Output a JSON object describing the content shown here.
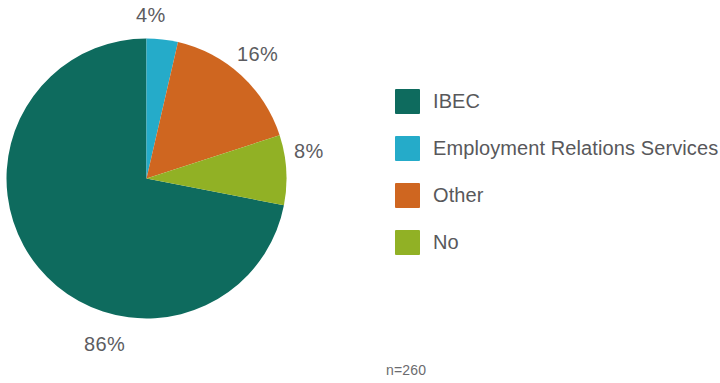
{
  "chart_data": {
    "type": "pie",
    "title": "",
    "subtitle": "",
    "xlabel": "",
    "ylabel": "",
    "grid": false,
    "legend_position": "right",
    "sample_note": "n=260",
    "categories": [
      "IBEC",
      "Employment Relations Services",
      "Other",
      "No"
    ],
    "values": [
      86,
      4,
      16,
      8
    ],
    "value_labels": [
      "86%",
      "4%",
      "16%",
      "8%"
    ],
    "colors": [
      "#0e6b5e",
      "#25abc9",
      "#cf6620",
      "#91b125"
    ],
    "slices": [
      {
        "label": "IBEC",
        "value": 86,
        "value_label": "86%",
        "color": "#0e6b5e",
        "start_angle": 101,
        "end_angle": 360
      },
      {
        "label": "Employment Relations Services",
        "value": 4,
        "value_label": "4%",
        "color": "#25abc9",
        "start_angle": 0,
        "end_angle": 13
      },
      {
        "label": "Other",
        "value": 16,
        "value_label": "16%",
        "color": "#cf6620",
        "start_angle": 13,
        "end_angle": 72
      },
      {
        "label": "No",
        "value": 8,
        "value_label": "8%",
        "color": "#91b125",
        "start_angle": 72,
        "end_angle": 101
      }
    ]
  },
  "labels": {
    "top": "4%",
    "upper_right": "16%",
    "right": "8%",
    "bottom": "86%"
  },
  "legend": {
    "items": [
      {
        "label": "IBEC",
        "color": "#0e6b5e"
      },
      {
        "label": "Employment Relations Services",
        "color": "#25abc9"
      },
      {
        "label": "Other",
        "color": "#cf6620"
      },
      {
        "label": "No",
        "color": "#91b125"
      }
    ]
  },
  "footer": {
    "sample_size": "n=260"
  }
}
